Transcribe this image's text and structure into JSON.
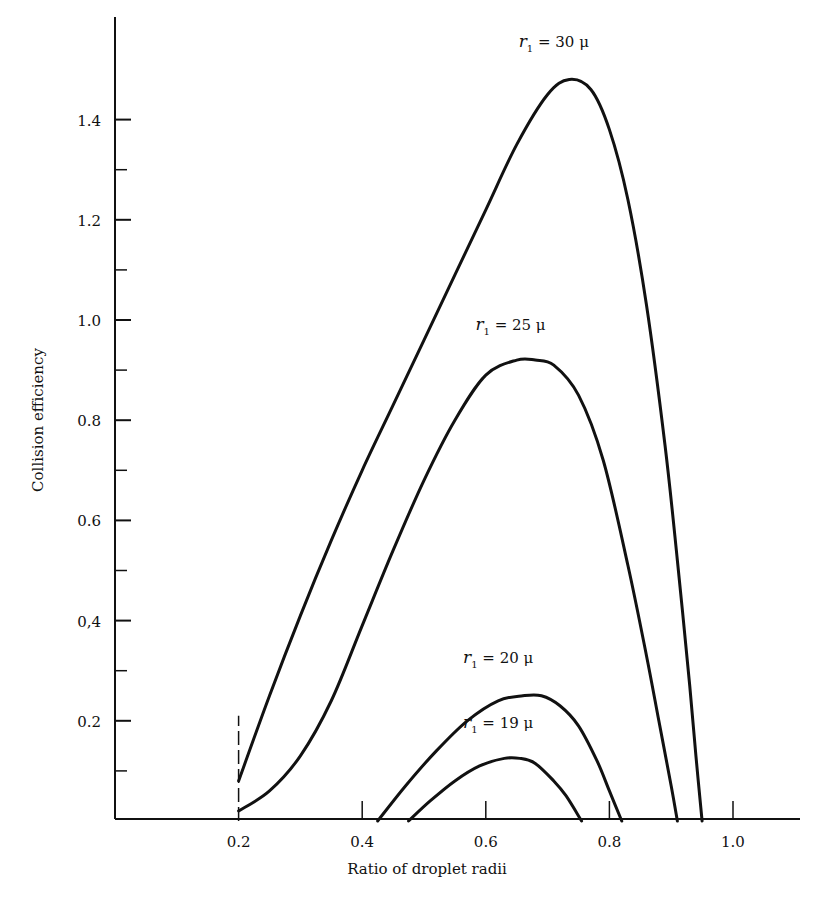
{
  "chart_data": {
    "type": "line",
    "title": "",
    "xlabel": "Ratio of droplet radii",
    "ylabel": "Collision efficiency",
    "xlim": [
      0,
      1.11
    ],
    "ylim": [
      0,
      1.6
    ],
    "grid": false,
    "legend": "inline labels near curve peaks",
    "x_ticks": [
      0.2,
      0.4,
      0.6,
      0.8,
      1.0
    ],
    "x_tick_labels": [
      "0.2",
      "0.4",
      "0.6",
      "0.8",
      "1.0"
    ],
    "y_ticks": [
      0.2,
      0.4,
      0.6,
      0.8,
      1.0,
      1.2,
      1.4
    ],
    "y_tick_labels": [
      "0.2",
      "0,4",
      "0.6",
      "0.8",
      "1.0",
      "1.2",
      "1.4"
    ],
    "y_minor_ticks": [
      0.1,
      0.3,
      0.5,
      0.7,
      0.9,
      1.1,
      1.3
    ],
    "annotations": [
      {
        "type": "dashed-vertical-line",
        "x": 0.2,
        "y_from": 0,
        "y_to": 0.21
      }
    ],
    "series": [
      {
        "name": "r1 = 30 μ",
        "label_prefix": "r",
        "label_sub": "1",
        "label_value": " = 30 μ",
        "x": [
          0.2,
          0.25,
          0.3,
          0.35,
          0.4,
          0.45,
          0.5,
          0.55,
          0.6,
          0.65,
          0.7,
          0.735,
          0.77,
          0.8,
          0.83,
          0.86,
          0.89,
          0.91,
          0.93,
          0.94,
          0.95
        ],
        "values": [
          0.08,
          0.25,
          0.41,
          0.56,
          0.7,
          0.83,
          0.96,
          1.09,
          1.22,
          1.35,
          1.45,
          1.48,
          1.46,
          1.38,
          1.24,
          1.03,
          0.75,
          0.52,
          0.27,
          0.13,
          0.0
        ]
      },
      {
        "name": "r1 = 25 μ",
        "label_prefix": "r",
        "label_sub": "1",
        "label_value": " = 25 μ",
        "x": [
          0.2,
          0.25,
          0.3,
          0.35,
          0.4,
          0.45,
          0.5,
          0.55,
          0.6,
          0.65,
          0.68,
          0.71,
          0.75,
          0.79,
          0.83,
          0.86,
          0.88,
          0.9,
          0.91
        ],
        "values": [
          0.02,
          0.06,
          0.13,
          0.24,
          0.39,
          0.54,
          0.68,
          0.8,
          0.89,
          0.92,
          0.92,
          0.91,
          0.85,
          0.72,
          0.51,
          0.33,
          0.2,
          0.07,
          0.0
        ]
      },
      {
        "name": "r1 = 20 μ",
        "label_prefix": "r",
        "label_sub": "1",
        "label_value": " = 20 μ",
        "x": [
          0.425,
          0.47,
          0.52,
          0.57,
          0.62,
          0.66,
          0.69,
          0.72,
          0.75,
          0.78,
          0.8,
          0.82
        ],
        "values": [
          0.0,
          0.07,
          0.14,
          0.2,
          0.24,
          0.25,
          0.25,
          0.23,
          0.19,
          0.12,
          0.06,
          0.0
        ]
      },
      {
        "name": "r1 = 19 μ",
        "label_prefix": "r",
        "label_sub": "1",
        "label_value": " = 19 μ",
        "x": [
          0.475,
          0.51,
          0.55,
          0.59,
          0.63,
          0.655,
          0.68,
          0.71,
          0.73,
          0.755
        ],
        "values": [
          0.0,
          0.04,
          0.08,
          0.11,
          0.125,
          0.125,
          0.115,
          0.08,
          0.05,
          0.0
        ]
      }
    ],
    "label_positions": [
      {
        "series": 0,
        "x": 0.71,
        "y": 1.545
      },
      {
        "series": 1,
        "x": 0.64,
        "y": 0.98
      },
      {
        "series": 2,
        "x": 0.62,
        "y": 0.315
      },
      {
        "series": 3,
        "x": 0.62,
        "y": 0.185
      }
    ]
  },
  "plot_layout": {
    "x0_px": 115,
    "px_per_x": 618,
    "y0_px": 821,
    "px_per_y": 501,
    "axis_top_px": 17,
    "axis_right_px": 800
  }
}
